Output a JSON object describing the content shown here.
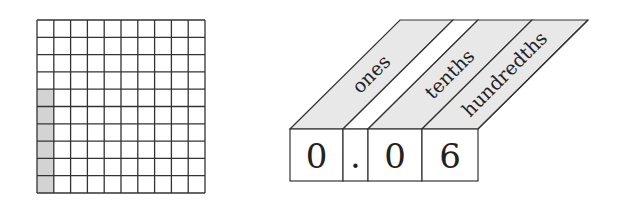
{
  "grid": {
    "rows": 10,
    "cols": 10,
    "shaded_cells": [
      {
        "row": 4,
        "col": 0
      },
      {
        "row": 5,
        "col": 0
      },
      {
        "row": 6,
        "col": 0
      },
      {
        "row": 7,
        "col": 0
      },
      {
        "row": 8,
        "col": 0
      },
      {
        "row": 9,
        "col": 0
      }
    ],
    "shade_color": "#d3d3d3",
    "line_color": "#333333"
  },
  "place_value_chart": {
    "columns": [
      {
        "label": "ones",
        "digit": "0",
        "shaded": true
      },
      {
        "label": "",
        "digit": ".",
        "shaded": false
      },
      {
        "label": "tenths",
        "digit": "0",
        "shaded": true
      },
      {
        "label": "hundredths",
        "digit": "6",
        "shaded": true
      }
    ],
    "header_color": "#e8e8e8"
  }
}
